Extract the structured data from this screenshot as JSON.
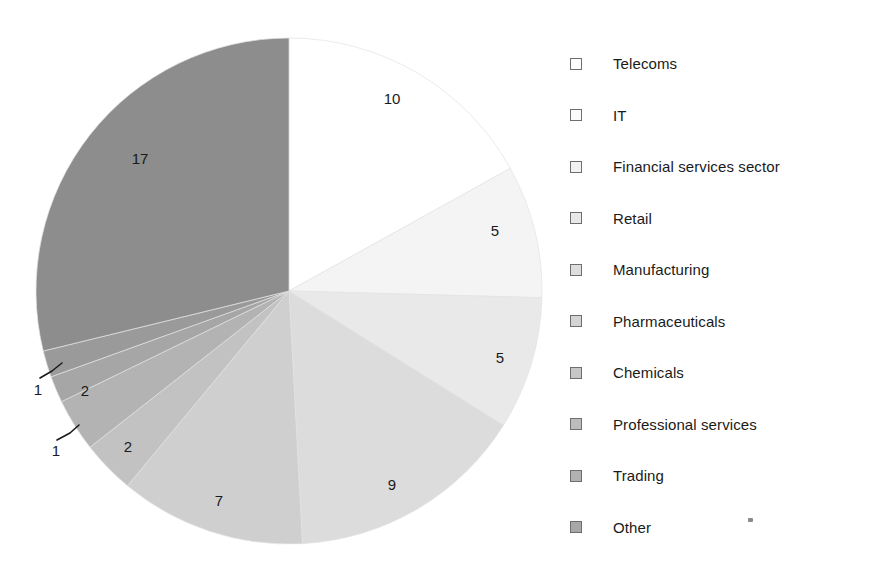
{
  "title": "",
  "chart_data": {
    "type": "pie",
    "title": "",
    "xlabel": "",
    "ylabel": "",
    "total": 59,
    "start_angle_deg": 0,
    "direction": "clockwise",
    "categories": [
      "Telecoms",
      "IT",
      "Financial services sector",
      "Retail",
      "Manufacturing",
      "Pharmaceuticals",
      "Chemicals",
      "Professional services",
      "Trading",
      "Other"
    ],
    "values": [
      10,
      5,
      5,
      9,
      7,
      2,
      2,
      1,
      1,
      17
    ],
    "colors": [
      "#ffffff",
      "#f4f4f4",
      "#e9e9e9",
      "#dcdcdc",
      "#cfcfcf",
      "#c2c2c2",
      "#b3b3b3",
      "#a6a6a6",
      "#9a9a9a",
      "#8d8d8d"
    ],
    "legend_position": "right",
    "grid": false,
    "slices": [
      {
        "label": "Telecoms",
        "value": 10,
        "value_text": "10",
        "color": "#ffffff",
        "lx": 392,
        "ly": 100,
        "leader": null
      },
      {
        "label": "IT",
        "value": 5,
        "value_text": "5",
        "color": "#f4f4f4",
        "lx": 495,
        "ly": 232,
        "leader": null
      },
      {
        "label": "Financial services sector",
        "value": 5,
        "value_text": "5",
        "color": "#e9e9e9",
        "lx": 500,
        "ly": 359,
        "leader": null
      },
      {
        "label": "Retail",
        "value": 9,
        "value_text": "9",
        "color": "#dcdcdc",
        "lx": 392,
        "ly": 486,
        "leader": null
      },
      {
        "label": "Manufacturing",
        "value": 7,
        "value_text": "7",
        "color": "#cfcfcf",
        "lx": 219,
        "ly": 502,
        "leader": null
      },
      {
        "label": "Pharmaceuticals",
        "value": 2,
        "value_text": "2",
        "color": "#c2c2c2",
        "lx": 128,
        "ly": 448,
        "leader": null
      },
      {
        "label": "Chemicals",
        "value": 2,
        "value_text": "2",
        "color": "#b3b3b3",
        "lx": 85,
        "ly": 392,
        "leader": null
      },
      {
        "label": "Professional services",
        "value": 1,
        "value_text": "1",
        "color": "#a6a6a6",
        "lx": 56,
        "ly": 452,
        "leader": "M 57 440 L 70 433 L 79 425"
      },
      {
        "label": "Trading",
        "value": 1,
        "value_text": "1",
        "color": "#9a9a9a",
        "lx": 38,
        "ly": 391,
        "leader": "M 40 378 L 52 371 L 62 363"
      },
      {
        "label": "Other",
        "value": 17,
        "value_text": "17",
        "color": "#8d8d8d",
        "lx": 140,
        "ly": 160,
        "leader": null
      }
    ]
  },
  "legend": {
    "items": [
      {
        "label": "Telecoms",
        "color": "#ffffff"
      },
      {
        "label": "IT",
        "color": "#fbfbfb"
      },
      {
        "label": "Financial services sector",
        "color": "#f2f2f2"
      },
      {
        "label": "Retail",
        "color": "#e8e8e8"
      },
      {
        "label": "Manufacturing",
        "color": "#dedede"
      },
      {
        "label": "Pharmaceuticals",
        "color": "#d4d4d4"
      },
      {
        "label": "Chemicals",
        "color": "#c6c6c6"
      },
      {
        "label": "Professional services",
        "color": "#bcbcbc"
      },
      {
        "label": "Trading",
        "color": "#b2b2b2"
      },
      {
        "label": "Other",
        "color": "#a8a8a8"
      }
    ]
  }
}
